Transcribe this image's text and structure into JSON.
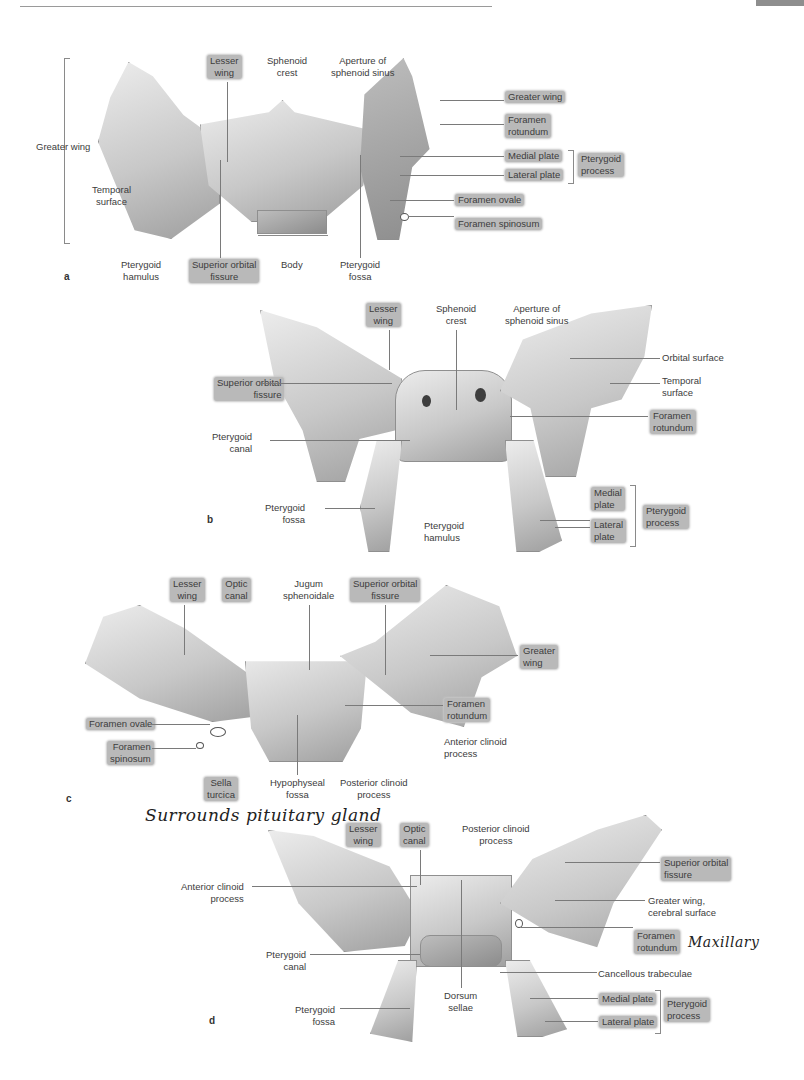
{
  "page": {
    "header_rule": true,
    "corner_tab_color": "#8e8e8e",
    "highlight_color": "#b9b9b9"
  },
  "figures": {
    "a": {
      "letter": "a",
      "labels": {
        "greater_wing_left": "Greater wing",
        "temporal_surface": "Temporal\nsurface",
        "lesser_wing": "Lesser\nwing",
        "sphenoid_crest": "Sphenoid\ncrest",
        "aperture": "Aperture of\nsphenoid sinus",
        "greater_wing_right": "Greater wing",
        "foramen_rotundum": "Foramen\nrotundum",
        "medial_plate": "Medial plate",
        "lateral_plate": "Lateral plate",
        "pterygoid_process": "Pterygoid\nprocess",
        "foramen_ovale": "Foramen ovale",
        "foramen_spinosum": "Foramen spinosum",
        "pterygoid_hamulus": "Pterygoid\nhamulus",
        "superior_orbital_fissure": "Superior orbital\nfissure",
        "body": "Body",
        "pterygoid_fossa": "Pterygoid\nfossa"
      }
    },
    "b": {
      "letter": "b",
      "labels": {
        "lesser_wing": "Lesser\nwing",
        "sphenoid_crest": "Sphenoid\ncrest",
        "aperture": "Aperture of\nsphenoid sinus",
        "orbital_surface": "Orbital surface",
        "temporal_surface": "Temporal\nsurface",
        "superior_orbital_fissure": "Superior orbital\nfissure",
        "foramen_rotundum": "Foramen\nrotundum",
        "pterygoid_canal": "Pterygoid\ncanal",
        "pterygoid_fossa": "Pterygoid\nfossa",
        "pterygoid_hamulus": "Pterygoid\nhamulus",
        "medial_plate": "Medial\nplate",
        "lateral_plate": "Lateral\nplate",
        "pterygoid_process": "Pterygoid\nprocess"
      }
    },
    "c": {
      "letter": "c",
      "labels": {
        "lesser_wing": "Lesser\nwing",
        "optic_canal": "Optic\ncanal",
        "jugum": "Jugum\nsphenoidale",
        "superior_orbital_fissure": "Superior orbital\nfissure",
        "greater_wing": "Greater\nwing",
        "foramen_rotundum": "Foramen\nrotundum",
        "anterior_clinoid": "Anterior clinoid\nprocess",
        "foramen_ovale": "Foramen ovale",
        "foramen_spinosum": "Foramen\nspinosum",
        "sella_turcica": "Sella\nturcica",
        "hypophyseal_fossa": "Hypophyseal\nfossa",
        "posterior_clinoid": "Posterior clinoid\nprocess"
      },
      "handwritten_note": "Surrounds pituitary gland"
    },
    "d": {
      "letter": "d",
      "labels": {
        "lesser_wing": "Lesser\nwing",
        "optic_canal": "Optic\ncanal",
        "posterior_clinoid": "Posterior clinoid\nprocess",
        "anterior_clinoid": "Anterior clinoid\nprocess",
        "superior_orbital_fissure": "Superior orbital\nfissure",
        "greater_wing_cerebral": "Greater wing,\ncerebral surface",
        "foramen_rotundum": "Foramen\nrotundum",
        "pterygoid_canal": "Pterygoid\ncanal",
        "cancellous_trabeculae": "Cancellous trabeculae",
        "dorsum_sellae": "Dorsum\nsellae",
        "pterygoid_fossa": "Pterygoid\nfossa",
        "medial_plate": "Medial plate",
        "lateral_plate": "Lateral plate",
        "pterygoid_process": "Pterygoid\nprocess"
      },
      "handwritten_note": "Maxillary"
    }
  }
}
